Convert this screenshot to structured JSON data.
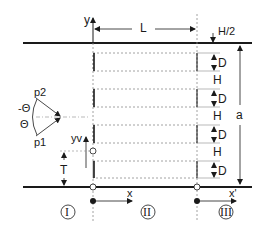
{
  "diagram": {
    "axes": {
      "y": "y",
      "x": "x",
      "x_prime": "x'",
      "yv": "yv"
    },
    "dimensions": {
      "L": "L",
      "H_half": "H/2",
      "a": "a",
      "T": "T",
      "D": "D",
      "H": "H"
    },
    "plates": [
      {
        "gap_label": "D",
        "spacing_label": "H"
      },
      {
        "gap_label": "D",
        "spacing_label": "H"
      },
      {
        "gap_label": "D",
        "spacing_label": "H"
      },
      {
        "gap_label": "D"
      }
    ],
    "probes": {
      "p1": "p1",
      "p2": "p2",
      "theta": "Θ",
      "neg_theta": "-Θ"
    },
    "regions": [
      {
        "label": "I"
      },
      {
        "label": "II"
      },
      {
        "label": "III"
      }
    ],
    "colors": {
      "line": "#1a1a1a",
      "dashed": "#8a8a8a",
      "background": "#ffffff"
    }
  }
}
